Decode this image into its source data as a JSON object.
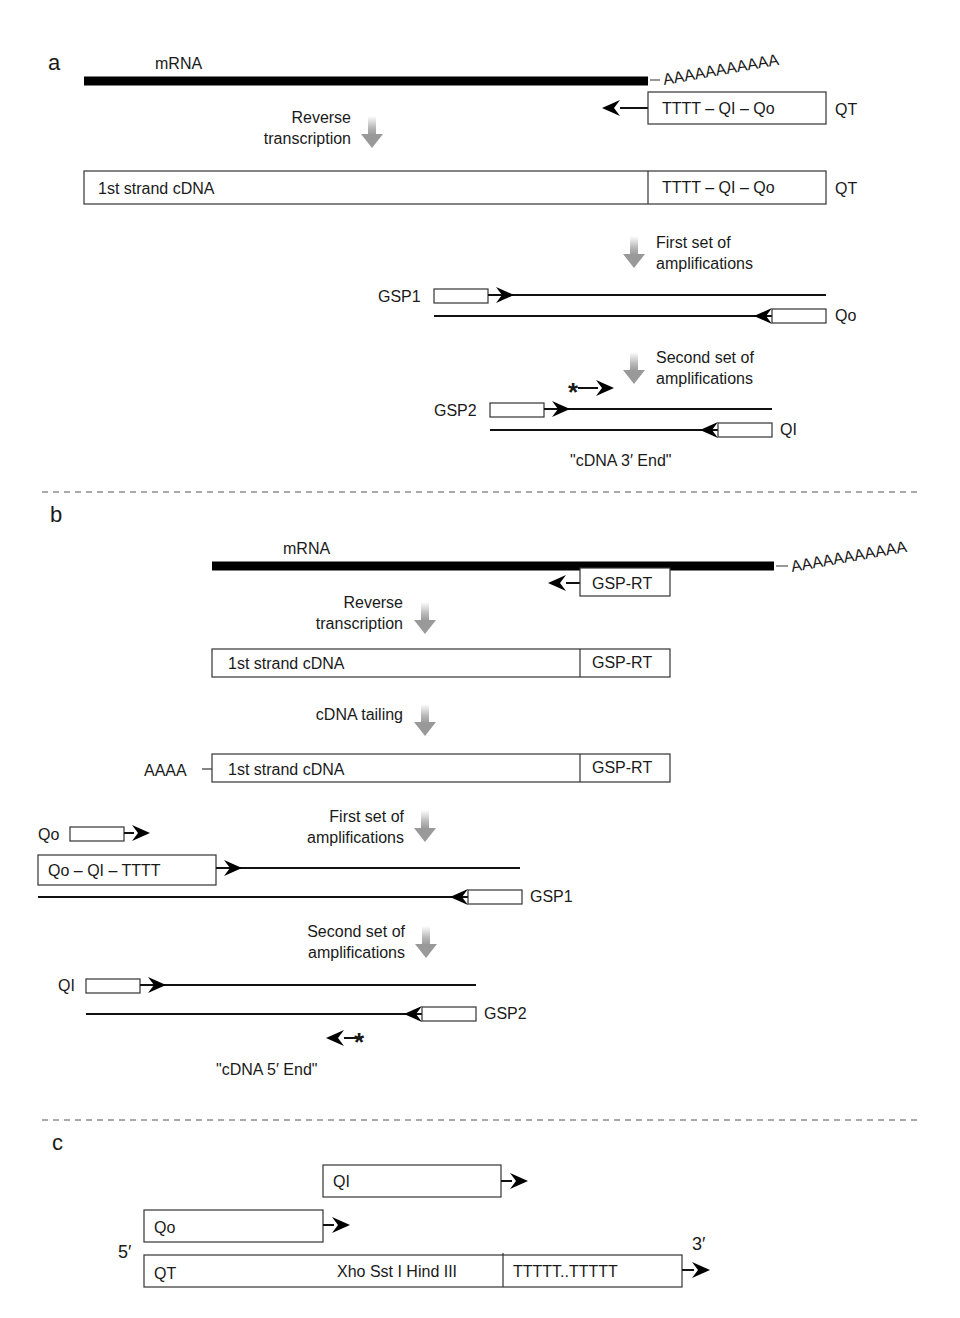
{
  "figure": {
    "panel_labels": [
      "a",
      "b",
      "c"
    ],
    "colors": {
      "strand": "#000000",
      "box_border": "#333333",
      "step_arrow": "#9a9a9a",
      "divider": "#555555"
    }
  },
  "panel_a": {
    "label": "a",
    "mrna_label": "mRNA",
    "polyA": "AAAAAAAAAAA",
    "qt_primer_box": "TTTT – QI – Qo",
    "qt_label": "QT",
    "step1": [
      "Reverse",
      "transcription"
    ],
    "cdna_label": "1st strand cDNA",
    "cdna_tail_box": "TTTT – QI – Qo",
    "cdna_qt_label": "QT",
    "step2": [
      "First set of",
      "amplifications"
    ],
    "gsp1_label": "GSP1",
    "qo_label": "Qo",
    "step3": [
      "Second set of",
      "amplifications"
    ],
    "gsp2_label": "GSP2",
    "qi_label": "QI",
    "result_label": "\"cDNA 3′ End\"",
    "star": "*"
  },
  "panel_b": {
    "label": "b",
    "mrna_label": "mRNA",
    "polyA": "AAAAAAAAAAA",
    "gsp_rt_box": "GSP-RT",
    "step1": [
      "Reverse",
      "transcription"
    ],
    "cdna_label": "1st strand cDNA",
    "cdna_gsp_box": "GSP-RT",
    "step2": [
      "cDNA tailing"
    ],
    "tail_prefix": "AAAA",
    "tailed_cdna_label": "1st strand cDNA",
    "tailed_gsp_box": "GSP-RT",
    "step3": [
      "First set of",
      "amplifications"
    ],
    "qo_label": "Qo",
    "qt_box": "Qo – QI – TTTT",
    "gsp1_label": "GSP1",
    "step4": [
      "Second set of",
      "amplifications"
    ],
    "qi_label": "QI",
    "gsp2_label": "GSP2",
    "result_label": "\"cDNA 5′ End\"",
    "star": "*"
  },
  "panel_c": {
    "label": "c",
    "qi_box": "QI",
    "qo_box": "Qo",
    "five_prime": "5′",
    "three_prime": "3′",
    "qt_label": "QT",
    "sites": "Xho  Sst I  Hind III",
    "polyT": "TTTTT..TTTTT"
  }
}
